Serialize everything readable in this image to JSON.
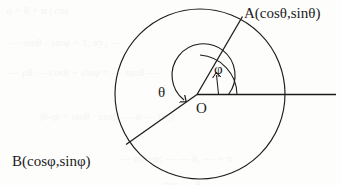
{
  "figure": {
    "colors": {
      "ink": "#1c1c1c",
      "paper": "#fdfdfc",
      "ghost": "#5a5a66"
    },
    "labels": {
      "point_a": "A(cosθ,sinθ)",
      "point_b": "B(cosφ,sinφ)",
      "origin": "O",
      "angle_theta": "θ",
      "angle_phi": "φ"
    },
    "geometry": {
      "center": {
        "x": 200,
        "y": 94
      },
      "radius": 85,
      "axis_ray_end_x": 335,
      "point_a_on_circle": {
        "x": 241,
        "y": 18
      },
      "point_b_on_circle": {
        "x": 128,
        "y": 143
      },
      "angle_a_degrees": 61,
      "angle_b_degrees": 214,
      "theta_arc_start_degrees": 0,
      "theta_arc_end_degrees": 214,
      "phi_arc_start_degrees": 0,
      "phi_arc_end_degrees": 180,
      "phi_arc_radius": 37,
      "theta_arc_radius": 28
    },
    "ghost_text": [
      {
        "text": "φ = θ + α  |  cos",
        "x": 6,
        "y": 4
      },
      {
        "text": "— sinθ · sinφ = 1,  αy₀ —",
        "x": 10,
        "y": 36
      },
      {
        "text": "— ρθ —  cosθ + sinφ = — tanθ —",
        "x": 8,
        "y": 66
      },
      {
        "text": "|θ‑φ| + sinθ · cosβ — φ — (θ₁)",
        "x": 40,
        "y": 110
      },
      {
        "text": "— α|θ+φ| — — θ₂ —  = π",
        "x": 120,
        "y": 152
      },
      {
        "text": "— cos — θ —",
        "x": 150,
        "y": 178
      }
    ]
  }
}
